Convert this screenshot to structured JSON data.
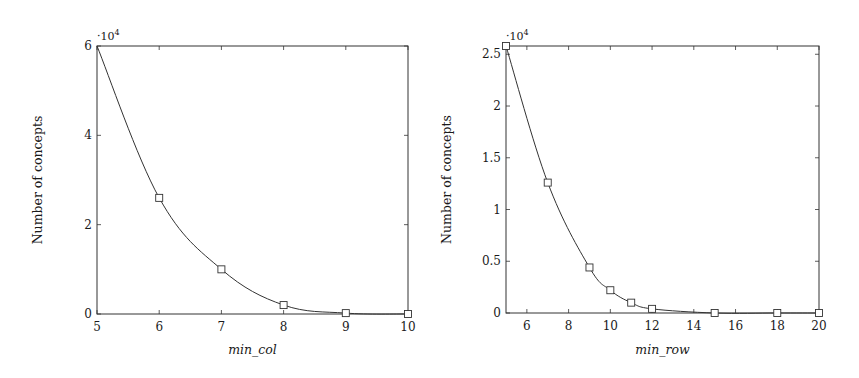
{
  "colors": {
    "line": "#333333",
    "axis": "#333333",
    "marker_fill": "#ffffff",
    "background": "#ffffff"
  },
  "chart_data": [
    {
      "type": "line",
      "title": "",
      "xlabel": "min_col",
      "ylabel": "Number of concepts",
      "y_multiplier": "·10",
      "y_multiplier_exp": "4",
      "xlim": [
        5,
        10
      ],
      "ylim": [
        0,
        6
      ],
      "xticks": [
        5,
        6,
        7,
        8,
        9,
        10
      ],
      "xtick_labels": [
        "5",
        "6",
        "7",
        "8",
        "9",
        "10"
      ],
      "yticks": [
        0,
        2,
        4,
        6
      ],
      "ytick_labels": [
        "0",
        "2",
        "4",
        "6"
      ],
      "grid": false,
      "legend": null,
      "marker": "square",
      "x": [
        5,
        6,
        7,
        8,
        9,
        10
      ],
      "y": [
        6.0,
        2.6,
        1.0,
        0.2,
        0.02,
        0.0
      ],
      "marker_mask": [
        false,
        true,
        true,
        true,
        true,
        true
      ],
      "y_unit_note": "values in units of 10^4 concepts"
    },
    {
      "type": "line",
      "title": "",
      "xlabel": "min_row",
      "ylabel": "Number of concepts",
      "y_multiplier": "·10",
      "y_multiplier_exp": "4",
      "xlim": [
        5,
        20
      ],
      "ylim": [
        0,
        2.58
      ],
      "xticks": [
        6,
        8,
        10,
        12,
        14,
        16,
        18,
        20
      ],
      "xtick_labels": [
        "6",
        "8",
        "10",
        "12",
        "14",
        "16",
        "18",
        "20"
      ],
      "yticks": [
        0,
        0.5,
        1,
        1.5,
        2,
        2.5
      ],
      "ytick_labels": [
        "0",
        "0.5",
        "1",
        "1.5",
        "2",
        "2.5"
      ],
      "grid": false,
      "legend": null,
      "marker": "square",
      "x": [
        5,
        7,
        9,
        10,
        11,
        12,
        15,
        18,
        20
      ],
      "y": [
        2.58,
        1.26,
        0.44,
        0.22,
        0.1,
        0.04,
        0.0,
        0.0,
        0.0
      ],
      "marker_mask": [
        true,
        true,
        true,
        true,
        true,
        true,
        true,
        true,
        true
      ],
      "y_unit_note": "values in units of 10^4 concepts"
    }
  ]
}
